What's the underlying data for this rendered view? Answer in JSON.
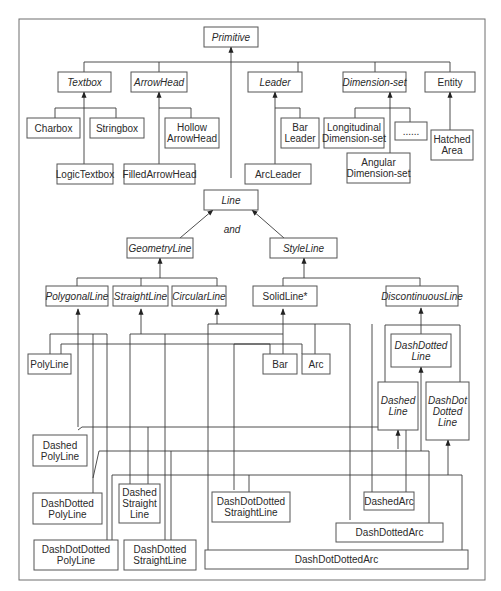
{
  "diagram": {
    "type": "class-hierarchy",
    "frame_color": "#6e6e6e",
    "line_color": "#3a3a3a",
    "nodes": {
      "primitive": {
        "label": [
          "Primitive"
        ],
        "abstract": true
      },
      "textbox": {
        "label": [
          "Textbox"
        ],
        "abstract": true
      },
      "arrowhead": {
        "label": [
          "ArrowHead"
        ],
        "abstract": true
      },
      "leader": {
        "label": [
          "Leader"
        ],
        "abstract": true
      },
      "dimension_set": {
        "label": [
          "Dimension-set"
        ],
        "abstract": true
      },
      "entity": {
        "label": [
          "Entity"
        ],
        "abstract": false
      },
      "charbox": {
        "label": [
          "Charbox"
        ],
        "abstract": false
      },
      "stringbox": {
        "label": [
          "Stringbox"
        ],
        "abstract": false
      },
      "logic_textbox": {
        "label": [
          "LogicTextbox"
        ],
        "abstract": false
      },
      "hollow_arrowhead": {
        "label": [
          "Hollow",
          "ArrowHead"
        ],
        "abstract": false
      },
      "filled_arrowhead": {
        "label": [
          "FilledArrowHead"
        ],
        "abstract": false
      },
      "bar_leader": {
        "label": [
          "Bar",
          "Leader"
        ],
        "abstract": false
      },
      "arc_leader": {
        "label": [
          "ArcLeader"
        ],
        "abstract": false
      },
      "longitudinal_dimension_set": {
        "label": [
          "Longitudinal",
          "Dimension-set"
        ],
        "abstract": false
      },
      "ellipsis": {
        "label": [
          "......"
        ],
        "abstract": false
      },
      "angular_dimension_set": {
        "label": [
          "Angular",
          "Dimension-set"
        ],
        "abstract": false
      },
      "hatched_area": {
        "label": [
          "Hatched",
          "Area"
        ],
        "abstract": false
      },
      "line": {
        "label": [
          "Line"
        ],
        "abstract": true
      },
      "and_text": {
        "label": [
          "and"
        ],
        "abstract": true
      },
      "geometry_line": {
        "label": [
          "GeometryLine"
        ],
        "abstract": true
      },
      "style_line": {
        "label": [
          "StyleLine"
        ],
        "abstract": true
      },
      "polygonal_line": {
        "label": [
          "PolygonalLine"
        ],
        "abstract": true
      },
      "straight_line": {
        "label": [
          "StraightLine"
        ],
        "abstract": true
      },
      "circular_line": {
        "label": [
          "CircularLine"
        ],
        "abstract": true
      },
      "solid_line": {
        "label": [
          "SolidLine*"
        ],
        "abstract": false
      },
      "discontinuous_line": {
        "label": [
          "DiscontinuousLine"
        ],
        "abstract": true
      },
      "polyline": {
        "label": [
          "PolyLine"
        ],
        "abstract": false
      },
      "bar": {
        "label": [
          "Bar"
        ],
        "abstract": false
      },
      "arc": {
        "label": [
          "Arc"
        ],
        "abstract": false
      },
      "dash_dotted_line": {
        "label": [
          "DashDotted",
          "Line"
        ],
        "abstract": true
      },
      "dashed_line": {
        "label": [
          "Dashed",
          "Line"
        ],
        "abstract": true
      },
      "dash_dot_dotted_line": {
        "label": [
          "DashDot",
          "Dotted",
          "Line"
        ],
        "abstract": true
      },
      "dashed_polyline": {
        "label": [
          "Dashed",
          "PolyLine"
        ],
        "abstract": false
      },
      "dash_dotted_polyline": {
        "label": [
          "DashDotted",
          "PolyLine"
        ],
        "abstract": false
      },
      "dashed_straight_line": {
        "label": [
          "Dashed",
          "Straight",
          "Line"
        ],
        "abstract": false
      },
      "dash_dot_dotted_straight_line": {
        "label": [
          "DashDotDotted",
          "StraightLine"
        ],
        "abstract": false
      },
      "dashed_arc": {
        "label": [
          "DashedArc"
        ],
        "abstract": false
      },
      "dash_dotted_arc": {
        "label": [
          "DashDottedArc"
        ],
        "abstract": false
      },
      "dash_dot_dotted_polyline": {
        "label": [
          "DashDotDotted",
          "PolyLine"
        ],
        "abstract": false
      },
      "dash_dotted_straight_line": {
        "label": [
          "DashDotted",
          "StraightLine"
        ],
        "abstract": false
      },
      "dash_dot_dotted_arc": {
        "label": [
          "DashDotDottedArc"
        ],
        "abstract": false
      }
    },
    "edges": [
      {
        "child": "textbox",
        "parent": "primitive"
      },
      {
        "child": "arrowhead",
        "parent": "primitive"
      },
      {
        "child": "leader",
        "parent": "primitive"
      },
      {
        "child": "dimension_set",
        "parent": "primitive"
      },
      {
        "child": "entity",
        "parent": "primitive"
      },
      {
        "child": "line",
        "parent": "primitive"
      },
      {
        "child": "charbox",
        "parent": "textbox"
      },
      {
        "child": "stringbox",
        "parent": "textbox"
      },
      {
        "child": "logic_textbox",
        "parent": "textbox"
      },
      {
        "child": "hollow_arrowhead",
        "parent": "arrowhead"
      },
      {
        "child": "filled_arrowhead",
        "parent": "arrowhead"
      },
      {
        "child": "bar_leader",
        "parent": "leader"
      },
      {
        "child": "arc_leader",
        "parent": "leader"
      },
      {
        "child": "longitudinal_dimension_set",
        "parent": "dimension_set"
      },
      {
        "child": "ellipsis",
        "parent": "dimension_set"
      },
      {
        "child": "angular_dimension_set",
        "parent": "dimension_set"
      },
      {
        "child": "hatched_area",
        "parent": "entity"
      },
      {
        "child": "geometry_line",
        "parent": "line"
      },
      {
        "child": "style_line",
        "parent": "line"
      },
      {
        "child": "polygonal_line",
        "parent": "geometry_line"
      },
      {
        "child": "straight_line",
        "parent": "geometry_line"
      },
      {
        "child": "circular_line",
        "parent": "geometry_line"
      },
      {
        "child": "solid_line",
        "parent": "style_line"
      },
      {
        "child": "discontinuous_line",
        "parent": "style_line"
      },
      {
        "child": "dash_dotted_line",
        "parent": "discontinuous_line"
      },
      {
        "child": "dashed_line",
        "parent": "dash_dotted_line"
      },
      {
        "child": "dash_dot_dotted_line",
        "parent": "dash_dotted_line"
      },
      {
        "child": "polyline",
        "parent": "polygonal_line"
      },
      {
        "child": "polyline",
        "parent": "solid_line"
      },
      {
        "child": "bar",
        "parent": "straight_line"
      },
      {
        "child": "bar",
        "parent": "solid_line"
      },
      {
        "child": "arc",
        "parent": "circular_line"
      },
      {
        "child": "arc",
        "parent": "solid_line"
      },
      {
        "child": "dashed_polyline",
        "parent": "polygonal_line"
      },
      {
        "child": "dashed_polyline",
        "parent": "dashed_line"
      },
      {
        "child": "dash_dotted_polyline",
        "parent": "polygonal_line"
      },
      {
        "child": "dash_dotted_polyline",
        "parent": "dash_dotted_line"
      },
      {
        "child": "dash_dot_dotted_polyline",
        "parent": "polygonal_line"
      },
      {
        "child": "dash_dot_dotted_polyline",
        "parent": "dash_dot_dotted_line"
      },
      {
        "child": "dashed_straight_line",
        "parent": "straight_line"
      },
      {
        "child": "dashed_straight_line",
        "parent": "dashed_line"
      },
      {
        "child": "dash_dotted_straight_line",
        "parent": "straight_line"
      },
      {
        "child": "dash_dotted_straight_line",
        "parent": "dash_dotted_line"
      },
      {
        "child": "dash_dot_dotted_straight_line",
        "parent": "straight_line"
      },
      {
        "child": "dash_dot_dotted_straight_line",
        "parent": "dash_dot_dotted_line"
      },
      {
        "child": "dashed_arc",
        "parent": "circular_line"
      },
      {
        "child": "dashed_arc",
        "parent": "dashed_line"
      },
      {
        "child": "dash_dotted_arc",
        "parent": "circular_line"
      },
      {
        "child": "dash_dotted_arc",
        "parent": "dash_dotted_line"
      },
      {
        "child": "dash_dot_dotted_arc",
        "parent": "circular_line"
      },
      {
        "child": "dash_dot_dotted_arc",
        "parent": "dash_dot_dotted_line"
      }
    ]
  }
}
